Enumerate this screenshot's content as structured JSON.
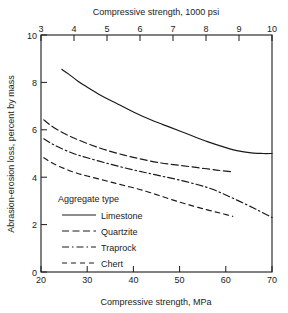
{
  "chart_data": {
    "type": "line",
    "title": "",
    "xlabel": "Compressive strength, MPa",
    "xlabel_top": "Compressive strength, 1000 psi",
    "ylabel": "Abrasion-erosion loss, percent by mass",
    "xlim": [
      20,
      70
    ],
    "ylim": [
      0,
      10
    ],
    "xlim_top": [
      3,
      10
    ],
    "grid": false,
    "legend_position": "lower-left-inside",
    "legend_title": "Aggregate type",
    "xticks": [
      20,
      30,
      40,
      50,
      60,
      70
    ],
    "xtick_labels": [
      "20",
      "30",
      "40",
      "50",
      "60",
      "70"
    ],
    "xticks_top": [
      3,
      4,
      5,
      6,
      7,
      8,
      9,
      10
    ],
    "xtick_labels_top": [
      "3",
      "4",
      "5",
      "6",
      "7",
      "8",
      "9",
      "10"
    ],
    "yticks": [
      0,
      2,
      4,
      6,
      8,
      10
    ],
    "ytick_labels": [
      "0",
      "2",
      "4",
      "6",
      "8",
      "10"
    ],
    "series": [
      {
        "name": "Limestone",
        "style": "solid",
        "dasharray": "",
        "x": [
          24.5,
          26,
          28,
          30,
          33,
          36,
          40,
          44,
          48,
          52,
          56,
          60,
          63,
          66,
          68,
          70
        ],
        "y": [
          8.55,
          8.35,
          8.05,
          7.8,
          7.45,
          7.15,
          6.75,
          6.4,
          6.1,
          5.8,
          5.5,
          5.25,
          5.1,
          5.02,
          5.0,
          5.0
        ]
      },
      {
        "name": "Quartzite",
        "style": "dashed",
        "dasharray": "7,3.5",
        "x": [
          20.6,
          22,
          24,
          26,
          28,
          31,
          34,
          38,
          42,
          46,
          50,
          54,
          58,
          61.5
        ],
        "y": [
          6.42,
          6.2,
          5.95,
          5.75,
          5.58,
          5.35,
          5.15,
          4.93,
          4.75,
          4.6,
          4.5,
          4.4,
          4.3,
          4.22
        ]
      },
      {
        "name": "Traprock",
        "style": "dashdot",
        "dasharray": "7,3,1.5,3",
        "x": [
          20.6,
          22,
          24,
          27,
          30,
          34,
          38,
          42,
          46,
          50,
          54,
          57,
          60,
          63,
          66,
          68,
          70
        ],
        "y": [
          5.62,
          5.45,
          5.25,
          5.0,
          4.82,
          4.6,
          4.4,
          4.22,
          4.05,
          3.88,
          3.68,
          3.5,
          3.25,
          2.98,
          2.7,
          2.5,
          2.3
        ]
      },
      {
        "name": "Chert",
        "style": "dashed-short",
        "dasharray": "5,4",
        "x": [
          20.6,
          22,
          24,
          27,
          30,
          34,
          38,
          42,
          46,
          50,
          53,
          56,
          58.5,
          60.5,
          61.5
        ],
        "y": [
          4.82,
          4.65,
          4.45,
          4.22,
          4.05,
          3.85,
          3.65,
          3.45,
          3.2,
          2.95,
          2.78,
          2.62,
          2.5,
          2.4,
          2.35
        ]
      }
    ]
  },
  "legend": {
    "title": "Aggregate type",
    "entries": [
      {
        "label": "Limestone",
        "dasharray": ""
      },
      {
        "label": "Quartzite",
        "dasharray": "7,3.5"
      },
      {
        "label": "Traprock",
        "dasharray": "7,3,1.5,3"
      },
      {
        "label": "Chert",
        "dasharray": "5,4"
      }
    ]
  },
  "colors": {
    "line": "#1a1a1a",
    "axis": "#1a1a1a",
    "background": "#ffffff"
  }
}
